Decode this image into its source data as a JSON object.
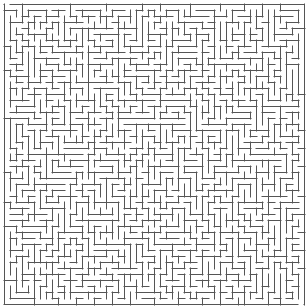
{
  "maze": {
    "cols": 50,
    "rows": 50,
    "cell_size": 6,
    "offset_x": 4,
    "offset_y": 4,
    "wall_color": "#555555",
    "background_color": "#ffffff",
    "wall_width": 1,
    "seed": 1337,
    "entrance": {
      "side": "top",
      "col": 0
    },
    "exit": {
      "side": "bottom",
      "col": 49
    }
  }
}
